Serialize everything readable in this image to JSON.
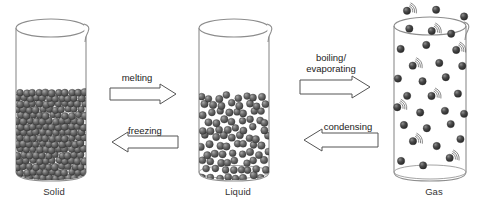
{
  "diagram": {
    "type": "phase-change-diagram",
    "background_color": "#ffffff"
  },
  "states": [
    {
      "id": "solid",
      "label": "Solid",
      "container": "beaker",
      "particle_arrangement": "closely packed ordered lattice filling lower portion of beaker",
      "fill_level_fraction": 0.55,
      "particle_color": "#5a5a5a",
      "particle_count": 170,
      "motion_lines": false
    },
    {
      "id": "liquid",
      "label": "Liquid",
      "container": "beaker",
      "particle_arrangement": "loosely packed random particles filling lower half of beaker",
      "fill_level_fraction": 0.52,
      "particle_color": "#5a5a5a",
      "particle_count": 95,
      "motion_lines": false
    },
    {
      "id": "gas",
      "label": "Gas",
      "container": "beaker",
      "particle_arrangement": "widely spaced particles dispersed throughout and escaping above the beaker",
      "fill_level_fraction": 1.0,
      "particle_color": "#3a3a3a",
      "particle_count": 30,
      "motion_lines": true
    }
  ],
  "transitions": [
    {
      "id": "melting",
      "label": "melting",
      "from": "solid",
      "to": "liquid",
      "direction": "right"
    },
    {
      "id": "freezing",
      "label": "freezing",
      "from": "liquid",
      "to": "solid",
      "direction": "left"
    },
    {
      "id": "boiling-evaporating",
      "label": "boiling/\nevaporating",
      "from": "liquid",
      "to": "gas",
      "direction": "right"
    },
    {
      "id": "condensing",
      "label": "condensing",
      "from": "gas",
      "to": "liquid",
      "direction": "left"
    }
  ],
  "colors": {
    "beaker_outline": "#8d8d8d",
    "particle_dark": "#4f4f4f",
    "particle_highlight": "#bdbdbd",
    "arrow_outline": "#555555",
    "arrow_fill": "#ffffff",
    "text": "#333333"
  }
}
